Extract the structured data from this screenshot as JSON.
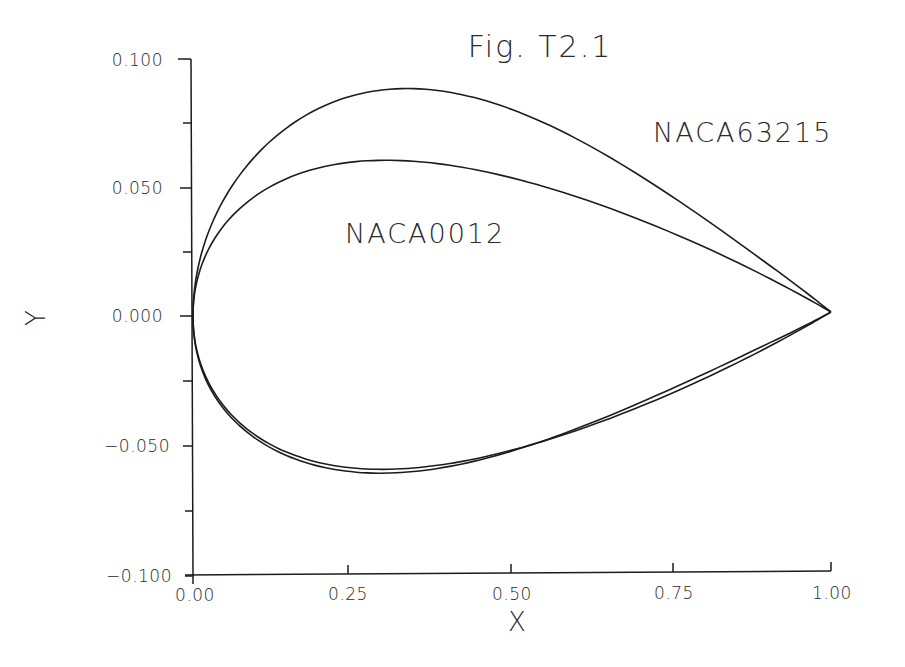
{
  "chart_data": {
    "type": "line",
    "title": "Fig. T2.1",
    "xlabel": "X",
    "ylabel": "Y",
    "xlim": [
      0.0,
      1.0
    ],
    "ylim": [
      -0.1,
      0.1
    ],
    "grid": false,
    "x_ticks": [
      "0.00",
      "0.25",
      "0.50",
      "0.75",
      "1.00"
    ],
    "y_ticks": [
      "0.100",
      "0.050",
      "0.000",
      "−0.050",
      "−0.100"
    ],
    "annotations": [
      "NACA63215",
      "NACA0012"
    ],
    "series": [
      {
        "name": "NACA63215",
        "upper": {
          "x": [
            0.0,
            0.01,
            0.025,
            0.05,
            0.1,
            0.15,
            0.2,
            0.25,
            0.3,
            0.35,
            0.4,
            0.5,
            0.6,
            0.7,
            0.8,
            0.9,
            0.95,
            1.0
          ],
          "y": [
            0.0,
            0.016,
            0.027,
            0.039,
            0.055,
            0.065,
            0.072,
            0.0755,
            0.0765,
            0.076,
            0.074,
            0.0665,
            0.0555,
            0.0425,
            0.028,
            0.0135,
            0.006,
            0.0
          ]
        },
        "lower": {
          "x": [
            0.0,
            0.01,
            0.025,
            0.05,
            0.1,
            0.15,
            0.2,
            0.25,
            0.3,
            0.35,
            0.4,
            0.5,
            0.6,
            0.7,
            0.8,
            0.9,
            0.95,
            1.0
          ],
          "y": [
            0.0,
            -0.012,
            -0.019,
            -0.027,
            -0.039,
            -0.0465,
            -0.051,
            -0.0535,
            -0.0545,
            -0.0545,
            -0.0535,
            -0.0495,
            -0.041,
            -0.0305,
            -0.019,
            -0.008,
            -0.003,
            0.0
          ]
        }
      },
      {
        "name": "NACA0012",
        "upper": {
          "x": [
            0.0,
            0.0125,
            0.025,
            0.05,
            0.075,
            0.1,
            0.15,
            0.2,
            0.25,
            0.3,
            0.4,
            0.5,
            0.6,
            0.7,
            0.8,
            0.9,
            0.95,
            1.0
          ],
          "y": [
            0.0,
            0.0124,
            0.0185,
            0.0284,
            0.0358,
            0.0415,
            0.0496,
            0.0548,
            0.0581,
            0.06,
            0.0581,
            0.0529,
            0.0457,
            0.037,
            0.0271,
            0.0162,
            0.0101,
            0.0
          ]
        },
        "lower": {
          "x": [
            0.0,
            0.0125,
            0.025,
            0.05,
            0.075,
            0.1,
            0.15,
            0.2,
            0.25,
            0.3,
            0.4,
            0.5,
            0.6,
            0.7,
            0.8,
            0.9,
            0.95,
            1.0
          ],
          "y": [
            0.0,
            -0.0124,
            -0.0185,
            -0.0284,
            -0.0358,
            -0.0415,
            -0.0496,
            -0.0548,
            -0.0581,
            -0.06,
            -0.0581,
            -0.0529,
            -0.0457,
            -0.037,
            -0.0271,
            -0.0162,
            -0.0101,
            0.0
          ]
        }
      }
    ]
  },
  "figure": {
    "title": "Fig. T2.1",
    "xlabel": "X",
    "ylabel": "Y",
    "label_naca63215": "NACA63215",
    "label_naca0012": "NACA0012",
    "x_ticks": [
      "0.00",
      "0.25",
      "0.50",
      "0.75",
      "1.00"
    ],
    "y_ticks": [
      "0.100",
      "0.050",
      "0.000",
      "−0.050",
      "−0.100"
    ]
  }
}
